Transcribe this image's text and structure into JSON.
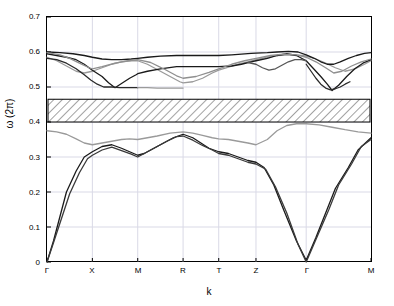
{
  "chart_data": {
    "type": "line",
    "title": "",
    "xlabel": "k",
    "ylabel": "ω (2π)",
    "ylim": [
      0,
      0.7
    ],
    "yticks": [
      "0",
      "0.1",
      "0.2",
      "0.3",
      "0.4",
      "0.5",
      "0.6",
      "0.7"
    ],
    "ytick_values": [
      0,
      0.1,
      0.2,
      0.3,
      0.4,
      0.5,
      0.6,
      0.7
    ],
    "xticks": [
      "Γ",
      "X",
      "M",
      "R",
      "T",
      "Z",
      "Γ",
      "M"
    ],
    "xtick_positions": [
      0,
      0.14,
      0.28,
      0.42,
      0.53,
      0.645,
      0.8,
      1.0
    ],
    "grid": true,
    "grid_color": "#d9d9e6",
    "bandgap": {
      "label": "",
      "ymin": 0.4,
      "ymax": 0.465,
      "fill": "hatched",
      "hatch_color": "#555555",
      "edge_color": "#000000"
    },
    "series": [
      {
        "name": "acoustic-band-1",
        "color": "#1a1a1a",
        "points": [
          [
            0.0,
            0.0
          ],
          [
            0.02,
            0.06
          ],
          [
            0.04,
            0.13
          ],
          [
            0.06,
            0.2
          ],
          [
            0.09,
            0.26
          ],
          [
            0.115,
            0.3
          ],
          [
            0.14,
            0.315
          ],
          [
            0.17,
            0.33
          ],
          [
            0.2,
            0.335
          ],
          [
            0.23,
            0.325
          ],
          [
            0.255,
            0.315
          ],
          [
            0.28,
            0.305
          ],
          [
            0.3,
            0.31
          ],
          [
            0.33,
            0.325
          ],
          [
            0.36,
            0.34
          ],
          [
            0.39,
            0.355
          ],
          [
            0.42,
            0.365
          ],
          [
            0.45,
            0.355
          ],
          [
            0.475,
            0.34
          ],
          [
            0.5,
            0.325
          ],
          [
            0.53,
            0.315
          ],
          [
            0.56,
            0.31
          ],
          [
            0.59,
            0.3
          ],
          [
            0.62,
            0.29
          ],
          [
            0.645,
            0.285
          ],
          [
            0.67,
            0.27
          ],
          [
            0.7,
            0.22
          ],
          [
            0.73,
            0.15
          ],
          [
            0.77,
            0.06
          ],
          [
            0.8,
            0.005
          ],
          [
            0.83,
            0.07
          ],
          [
            0.86,
            0.14
          ],
          [
            0.89,
            0.21
          ],
          [
            0.93,
            0.27
          ],
          [
            0.96,
            0.32
          ],
          [
            1.0,
            0.355
          ]
        ]
      },
      {
        "name": "acoustic-band-2",
        "color": "#3a3a3a",
        "points": [
          [
            0.0,
            0.0
          ],
          [
            0.02,
            0.055
          ],
          [
            0.045,
            0.125
          ],
          [
            0.07,
            0.195
          ],
          [
            0.1,
            0.255
          ],
          [
            0.125,
            0.295
          ],
          [
            0.14,
            0.305
          ],
          [
            0.17,
            0.32
          ],
          [
            0.2,
            0.328
          ],
          [
            0.23,
            0.318
          ],
          [
            0.26,
            0.308
          ],
          [
            0.28,
            0.3
          ],
          [
            0.31,
            0.315
          ],
          [
            0.34,
            0.33
          ],
          [
            0.37,
            0.345
          ],
          [
            0.4,
            0.358
          ],
          [
            0.42,
            0.36
          ],
          [
            0.45,
            0.348
          ],
          [
            0.48,
            0.333
          ],
          [
            0.51,
            0.32
          ],
          [
            0.53,
            0.31
          ],
          [
            0.56,
            0.305
          ],
          [
            0.59,
            0.295
          ],
          [
            0.62,
            0.285
          ],
          [
            0.645,
            0.28
          ],
          [
            0.675,
            0.265
          ],
          [
            0.705,
            0.215
          ],
          [
            0.74,
            0.14
          ],
          [
            0.775,
            0.05
          ],
          [
            0.8,
            0.0
          ],
          [
            0.835,
            0.075
          ],
          [
            0.87,
            0.15
          ],
          [
            0.9,
            0.22
          ],
          [
            0.94,
            0.28
          ],
          [
            0.97,
            0.33
          ],
          [
            1.0,
            0.35
          ]
        ]
      },
      {
        "name": "band-3-gray",
        "color": "#9a9a9a",
        "points": [
          [
            0.0,
            0.375
          ],
          [
            0.03,
            0.372
          ],
          [
            0.06,
            0.365
          ],
          [
            0.09,
            0.352
          ],
          [
            0.115,
            0.34
          ],
          [
            0.14,
            0.335
          ],
          [
            0.17,
            0.34
          ],
          [
            0.2,
            0.345
          ],
          [
            0.23,
            0.35
          ],
          [
            0.255,
            0.352
          ],
          [
            0.28,
            0.35
          ],
          [
            0.31,
            0.355
          ],
          [
            0.34,
            0.36
          ],
          [
            0.38,
            0.368
          ],
          [
            0.42,
            0.372
          ],
          [
            0.45,
            0.368
          ],
          [
            0.48,
            0.362
          ],
          [
            0.51,
            0.355
          ],
          [
            0.53,
            0.352
          ],
          [
            0.56,
            0.35
          ],
          [
            0.59,
            0.345
          ],
          [
            0.62,
            0.34
          ],
          [
            0.645,
            0.335
          ],
          [
            0.68,
            0.35
          ],
          [
            0.71,
            0.375
          ],
          [
            0.74,
            0.39
          ],
          [
            0.77,
            0.395
          ],
          [
            0.8,
            0.395
          ],
          [
            0.84,
            0.392
          ],
          [
            0.88,
            0.385
          ],
          [
            0.92,
            0.378
          ],
          [
            0.96,
            0.372
          ],
          [
            1.0,
            0.368
          ]
        ]
      },
      {
        "name": "band-4-upper-gray",
        "color": "#9a9a9a",
        "points": [
          [
            0.0,
            0.585
          ],
          [
            0.03,
            0.575
          ],
          [
            0.06,
            0.56
          ],
          [
            0.09,
            0.545
          ],
          [
            0.115,
            0.54
          ],
          [
            0.14,
            0.545
          ],
          [
            0.17,
            0.555
          ],
          [
            0.2,
            0.565
          ],
          [
            0.23,
            0.572
          ],
          [
            0.26,
            0.575
          ],
          [
            0.28,
            0.575
          ],
          [
            0.31,
            0.565
          ],
          [
            0.34,
            0.55
          ],
          [
            0.38,
            0.53
          ],
          [
            0.41,
            0.515
          ],
          [
            0.42,
            0.512
          ],
          [
            0.45,
            0.515
          ],
          [
            0.48,
            0.525
          ],
          [
            0.51,
            0.54
          ],
          [
            0.53,
            0.548
          ],
          [
            0.56,
            0.557
          ],
          [
            0.59,
            0.565
          ],
          [
            0.62,
            0.572
          ],
          [
            0.645,
            0.578
          ],
          [
            0.68,
            0.585
          ],
          [
            0.71,
            0.59
          ],
          [
            0.75,
            0.592
          ],
          [
            0.79,
            0.59
          ],
          [
            0.8,
            0.588
          ],
          [
            0.83,
            0.58
          ],
          [
            0.86,
            0.568
          ],
          [
            0.89,
            0.555
          ],
          [
            0.92,
            0.545
          ],
          [
            0.95,
            0.552
          ],
          [
            0.98,
            0.565
          ],
          [
            1.0,
            0.575
          ]
        ]
      },
      {
        "name": "band-5-upper-black",
        "color": "#1a1a1a",
        "points": [
          [
            0.0,
            0.595
          ],
          [
            0.03,
            0.59
          ],
          [
            0.06,
            0.585
          ],
          [
            0.09,
            0.578
          ],
          [
            0.115,
            0.565
          ],
          [
            0.14,
            0.548
          ],
          [
            0.17,
            0.53
          ],
          [
            0.19,
            0.512
          ],
          [
            0.21,
            0.498
          ],
          [
            0.23,
            0.51
          ],
          [
            0.255,
            0.525
          ],
          [
            0.275,
            0.535
          ],
          [
            0.28,
            0.538
          ],
          [
            0.31,
            0.545
          ],
          [
            0.35,
            0.552
          ],
          [
            0.4,
            0.558
          ],
          [
            0.42,
            0.558
          ],
          [
            0.46,
            0.558
          ],
          [
            0.5,
            0.558
          ],
          [
            0.53,
            0.558
          ],
          [
            0.57,
            0.56
          ],
          [
            0.6,
            0.565
          ],
          [
            0.63,
            0.572
          ],
          [
            0.645,
            0.575
          ],
          [
            0.68,
            0.582
          ],
          [
            0.71,
            0.59
          ],
          [
            0.74,
            0.595
          ],
          [
            0.77,
            0.59
          ],
          [
            0.8,
            0.575
          ],
          [
            0.82,
            0.555
          ],
          [
            0.845,
            0.53
          ],
          [
            0.865,
            0.508
          ],
          [
            0.88,
            0.49
          ],
          [
            0.9,
            0.505
          ],
          [
            0.925,
            0.53
          ],
          [
            0.95,
            0.552
          ],
          [
            0.975,
            0.568
          ],
          [
            1.0,
            0.578
          ]
        ]
      },
      {
        "name": "band-6-top-black",
        "color": "#1a1a1a",
        "points": [
          [
            0.0,
            0.6
          ],
          [
            0.04,
            0.598
          ],
          [
            0.08,
            0.595
          ],
          [
            0.115,
            0.59
          ],
          [
            0.14,
            0.585
          ],
          [
            0.17,
            0.58
          ],
          [
            0.2,
            0.578
          ],
          [
            0.23,
            0.578
          ],
          [
            0.26,
            0.58
          ],
          [
            0.28,
            0.582
          ],
          [
            0.31,
            0.585
          ],
          [
            0.35,
            0.588
          ],
          [
            0.4,
            0.59
          ],
          [
            0.42,
            0.59
          ],
          [
            0.46,
            0.59
          ],
          [
            0.5,
            0.59
          ],
          [
            0.53,
            0.59
          ],
          [
            0.57,
            0.592
          ],
          [
            0.6,
            0.594
          ],
          [
            0.63,
            0.596
          ],
          [
            0.645,
            0.597
          ],
          [
            0.68,
            0.598
          ],
          [
            0.71,
            0.6
          ],
          [
            0.745,
            0.602
          ],
          [
            0.775,
            0.6
          ],
          [
            0.8,
            0.592
          ],
          [
            0.825,
            0.582
          ],
          [
            0.845,
            0.572
          ],
          [
            0.865,
            0.565
          ],
          [
            0.885,
            0.565
          ],
          [
            0.905,
            0.572
          ],
          [
            0.93,
            0.582
          ],
          [
            0.955,
            0.59
          ],
          [
            0.98,
            0.596
          ],
          [
            1.0,
            0.598
          ]
        ]
      },
      {
        "name": "band-7-mid-gray",
        "color": "#8f8f8f",
        "points": [
          [
            0.0,
            0.598
          ],
          [
            0.04,
            0.592
          ],
          [
            0.07,
            0.582
          ],
          [
            0.1,
            0.568
          ],
          [
            0.13,
            0.555
          ],
          [
            0.14,
            0.552
          ],
          [
            0.17,
            0.558
          ],
          [
            0.21,
            0.568
          ],
          [
            0.25,
            0.575
          ],
          [
            0.28,
            0.578
          ],
          [
            0.32,
            0.57
          ],
          [
            0.36,
            0.552
          ],
          [
            0.4,
            0.532
          ],
          [
            0.42,
            0.525
          ],
          [
            0.46,
            0.53
          ],
          [
            0.5,
            0.542
          ],
          [
            0.53,
            0.552
          ],
          [
            0.57,
            0.565
          ],
          [
            0.61,
            0.575
          ],
          [
            0.645,
            0.582
          ],
          [
            0.69,
            0.59
          ],
          [
            0.73,
            0.594
          ],
          [
            0.77,
            0.592
          ],
          [
            0.8,
            0.585
          ],
          [
            0.83,
            0.572
          ],
          [
            0.86,
            0.555
          ],
          [
            0.885,
            0.54
          ],
          [
            0.91,
            0.545
          ],
          [
            0.94,
            0.56
          ],
          [
            0.97,
            0.572
          ],
          [
            1.0,
            0.58
          ]
        ]
      },
      {
        "name": "band-8-dip-black",
        "color": "#2a2a2a",
        "points": [
          [
            0.0,
            0.582
          ],
          [
            0.03,
            0.578
          ],
          [
            0.06,
            0.568
          ],
          [
            0.09,
            0.552
          ],
          [
            0.115,
            0.535
          ],
          [
            0.135,
            0.52
          ],
          [
            0.155,
            0.508
          ],
          [
            0.175,
            0.5
          ],
          [
            0.2,
            0.5
          ],
          [
            0.225,
            0.498
          ],
          [
            0.25,
            0.498
          ],
          [
            0.275,
            0.498
          ],
          [
            0.28,
            0.498
          ]
        ]
      },
      {
        "name": "band-9-flat-gray",
        "color": "#9a9a9a",
        "points": [
          [
            0.28,
            0.498
          ],
          [
            0.31,
            0.498
          ],
          [
            0.34,
            0.497
          ],
          [
            0.37,
            0.497
          ],
          [
            0.4,
            0.497
          ],
          [
            0.42,
            0.497
          ]
        ]
      },
      {
        "name": "band-10-right-dip",
        "color": "#2a2a2a",
        "points": [
          [
            0.8,
            0.565
          ],
          [
            0.815,
            0.545
          ],
          [
            0.83,
            0.525
          ],
          [
            0.845,
            0.508
          ],
          [
            0.86,
            0.497
          ],
          [
            0.875,
            0.492
          ],
          [
            0.89,
            0.495
          ],
          [
            0.905,
            0.5
          ],
          [
            0.92,
            0.508
          ],
          [
            0.935,
            0.515
          ]
        ]
      },
      {
        "name": "band-11-z-cluster",
        "color": "#555555",
        "points": [
          [
            0.62,
            0.57
          ],
          [
            0.645,
            0.565
          ],
          [
            0.665,
            0.555
          ],
          [
            0.685,
            0.548
          ],
          [
            0.705,
            0.552
          ],
          [
            0.725,
            0.562
          ],
          [
            0.745,
            0.572
          ],
          [
            0.765,
            0.578
          ],
          [
            0.785,
            0.578
          ],
          [
            0.8,
            0.575
          ]
        ]
      }
    ]
  }
}
